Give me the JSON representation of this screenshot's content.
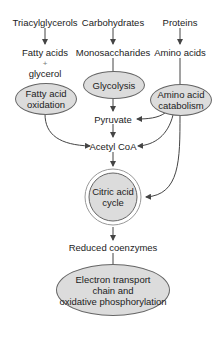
{
  "diagram": {
    "sources": {
      "triacylglycerols": "Triacylglycerols",
      "carbohydrates": "Carbohydrates",
      "proteins": "Proteins"
    },
    "intermediates": {
      "fatty_acids": "Fatty acids",
      "plus": "+",
      "glycerol": "glycerol",
      "monosaccharides": "Monosaccharides",
      "amino_acids": "Amino acids",
      "pyruvate": "Pyruvate",
      "acetyl_coa": "Acetyl CoA",
      "reduced_coenzymes": "Reduced coenzymes"
    },
    "processes": {
      "fatty_acid_oxidation": [
        "Fatty acid",
        "oxidation"
      ],
      "glycolysis": "Glycolysis",
      "amino_acid_catabolism": [
        "Amino acid",
        "catabolism"
      ],
      "citric_acid_cycle": [
        "Citric acid",
        "cycle"
      ],
      "etc": [
        "Electron transport",
        "chain and",
        "oxidative phosphorylation"
      ]
    },
    "colors": {
      "node_fill": "#dcdcdc",
      "stroke": "#444444"
    }
  }
}
